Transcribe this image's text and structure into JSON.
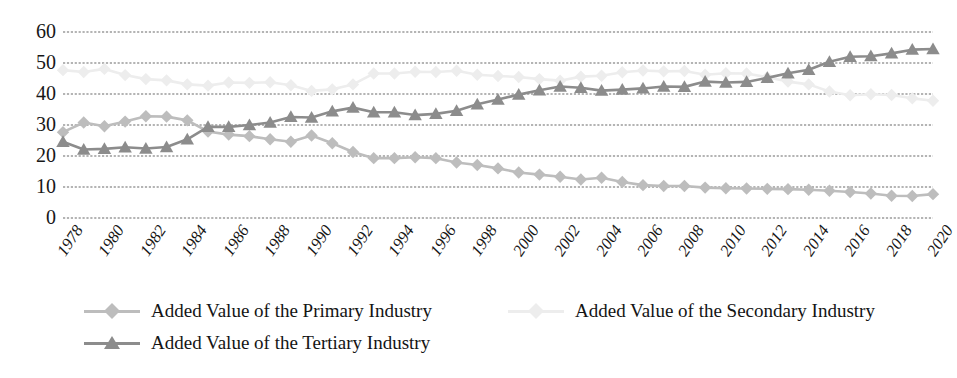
{
  "chart_data": {
    "type": "line",
    "title": "",
    "subtitle": "",
    "xlabel": "",
    "ylabel": "",
    "xlim": [
      1978,
      2020
    ],
    "ylim": [
      0,
      60
    ],
    "yticks": [
      0,
      10,
      20,
      30,
      40,
      50,
      60
    ],
    "grid": true,
    "grid_axis": "y",
    "legend_position": "bottom",
    "x": [
      1978,
      1979,
      1980,
      1981,
      1982,
      1983,
      1984,
      1985,
      1986,
      1987,
      1988,
      1989,
      1990,
      1991,
      1992,
      1993,
      1994,
      1995,
      1996,
      1997,
      1998,
      1999,
      2000,
      2001,
      2002,
      2003,
      2004,
      2005,
      2006,
      2007,
      2008,
      2009,
      2010,
      2011,
      2012,
      2013,
      2014,
      2015,
      2016,
      2017,
      2018,
      2019,
      2020
    ],
    "xtick_labels": [
      "1978",
      "1980",
      "1982",
      "1984",
      "1986",
      "1988",
      "1990",
      "1992",
      "1994",
      "1996",
      "1998",
      "2000",
      "2002",
      "2004",
      "2006",
      "2008",
      "2010",
      "2012",
      "2014",
      "2016",
      "2018",
      "2020"
    ],
    "series": [
      {
        "name": "Added Value of the Primary Industry",
        "marker": "diamond",
        "color": "#bdbdbd",
        "values": [
          27.7,
          30.8,
          29.6,
          31.1,
          32.8,
          32.7,
          31.5,
          27.9,
          26.9,
          26.4,
          25.4,
          24.6,
          26.6,
          24.1,
          21.3,
          19.3,
          19.3,
          19.6,
          19.3,
          17.9,
          17.1,
          16.0,
          14.7,
          14.0,
          13.3,
          12.4,
          13.0,
          11.6,
          10.6,
          10.3,
          10.3,
          9.8,
          9.6,
          9.5,
          9.4,
          9.3,
          9.1,
          8.8,
          8.4,
          7.9,
          7.2,
          7.1,
          7.7
        ]
      },
      {
        "name": "Added Value of the Secondary Industry",
        "marker": "diamond",
        "color": "#ededed",
        "values": [
          47.7,
          47.1,
          48.1,
          46.1,
          44.8,
          44.4,
          43.1,
          42.7,
          43.7,
          43.6,
          43.8,
          42.8,
          41.0,
          41.5,
          43.1,
          46.6,
          46.6,
          47.2,
          47.1,
          47.5,
          46.2,
          45.8,
          45.5,
          44.8,
          44.3,
          45.6,
          45.9,
          47.0,
          47.6,
          47.3,
          47.4,
          46.2,
          46.7,
          46.6,
          45.4,
          44.0,
          43.1,
          40.8,
          39.6,
          39.9,
          39.7,
          38.6,
          37.8
        ]
      },
      {
        "name": "Added Value of the Tertiary Industry",
        "marker": "triangle",
        "color": "#8c8c8c",
        "values": [
          24.6,
          22.1,
          22.3,
          22.8,
          22.4,
          22.9,
          25.4,
          29.4,
          29.4,
          30.0,
          30.8,
          32.6,
          32.4,
          34.4,
          35.6,
          34.1,
          34.1,
          33.2,
          33.6,
          34.6,
          36.7,
          38.2,
          39.8,
          41.2,
          42.4,
          42.0,
          41.1,
          41.4,
          41.8,
          42.4,
          42.3,
          44.0,
          43.7,
          43.9,
          45.2,
          46.7,
          47.8,
          50.4,
          52.0,
          52.2,
          53.1,
          54.3,
          54.5
        ]
      }
    ]
  },
  "legend": {
    "items": [
      {
        "label": "Added Value of the Primary Industry"
      },
      {
        "label": "Added Value of the Secondary Industry"
      },
      {
        "label": "Added Value of the Tertiary Industry"
      }
    ]
  },
  "colors": {
    "gridline": "#6b6b6b",
    "primary": "#bdbdbd",
    "secondary": "#ededed",
    "tertiary": "#8c8c8c",
    "text": "#171717",
    "background": "#ffffff"
  }
}
